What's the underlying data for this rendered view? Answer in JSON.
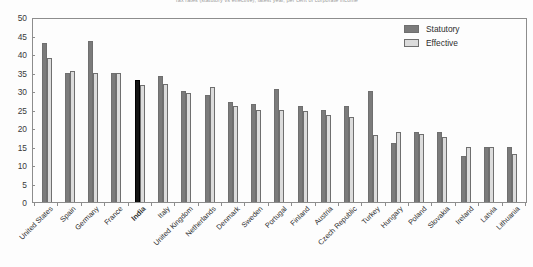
{
  "chart_data": {
    "type": "bar",
    "title": "Tax rates (statutory vs effective), latest year, per cent of corporate income",
    "xlabel": "",
    "ylabel": "",
    "ylim": [
      0,
      50
    ],
    "ytick_step": 5,
    "yticks": [
      0,
      5,
      10,
      15,
      20,
      25,
      30,
      35,
      40,
      45,
      50
    ],
    "grid": false,
    "legend_position": "top-right",
    "categories": [
      "United States",
      "Spain",
      "Germany",
      "France",
      "India",
      "Italy",
      "United Kingdom",
      "Netherlands",
      "Denmark",
      "Sweden",
      "Portugal",
      "Finland",
      "Austria",
      "Czech Republic",
      "Turkey",
      "Hungary",
      "Poland",
      "Slovakia",
      "Ireland",
      "Latvia",
      "Lithuania"
    ],
    "highlight_category": "India",
    "series": [
      {
        "name": "Statutory",
        "color": "#7b7b7b",
        "values": [
          43,
          35,
          43.5,
          35,
          33,
          34,
          30,
          29,
          27,
          26.5,
          30.5,
          26,
          25,
          26,
          30,
          16,
          19,
          19,
          12.5,
          15,
          15
        ]
      },
      {
        "name": "Effective",
        "color": "#dcdcdc",
        "values": [
          39,
          35.5,
          35,
          35,
          31.5,
          32,
          29.5,
          31,
          26,
          25,
          25,
          24.5,
          23.5,
          23,
          18,
          19,
          18.5,
          17.5,
          15,
          15,
          13
        ]
      }
    ]
  },
  "legend": {
    "entries": [
      {
        "label": "Statutory"
      },
      {
        "label": "Effective"
      }
    ]
  }
}
